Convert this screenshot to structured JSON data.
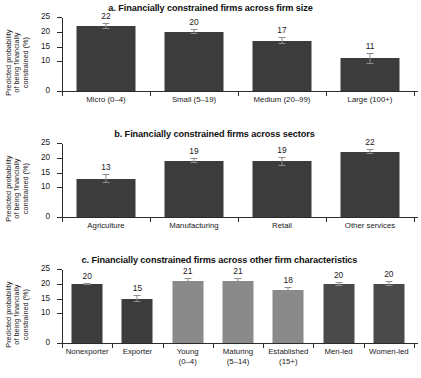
{
  "chart_data": [
    {
      "type": "bar",
      "panel": "a",
      "title": "a. Financially constrained firms across firm size",
      "ylabel": "Predicted probability of being financially constrained (%)",
      "ylabel_lines": [
        "Predicted probability",
        "of being financially",
        "constrained (%)"
      ],
      "xlabel": "",
      "ylim": [
        0,
        25
      ],
      "yticks": [
        0,
        10,
        15,
        20,
        25
      ],
      "ytick_labels": [
        "0",
        "10",
        "15",
        "20",
        "25"
      ],
      "grid": false,
      "legend": "none",
      "categories": [
        "Micro (0–4)",
        "Small (5–19)",
        "Medium (20–99)",
        "Large (100+)"
      ],
      "category_lines": [
        [
          "Micro (0–4)"
        ],
        [
          "Small (5–19)"
        ],
        [
          "Medium (20–99)"
        ],
        [
          "Large (100+)"
        ]
      ],
      "values": [
        22,
        20,
        17,
        11
      ],
      "value_labels": [
        "22",
        "20",
        "17",
        "11"
      ],
      "errors_low": [
        21.0,
        19.2,
        15.8,
        9.2
      ],
      "errors_high": [
        23.0,
        20.9,
        18.2,
        12.9
      ],
      "bar_colors": [
        "#3c3c3c",
        "#3c3c3c",
        "#3c3c3c",
        "#3c3c3c"
      ]
    },
    {
      "type": "bar",
      "panel": "b",
      "title": "b. Financially constrained firms across sectors",
      "ylabel": "Predicted probability of being financially constrained (%)",
      "ylabel_lines": [
        "Predicted probability",
        "of being financially",
        "constrained (%)"
      ],
      "xlabel": "",
      "ylim": [
        0,
        25
      ],
      "yticks": [
        0,
        10,
        15,
        20,
        25
      ],
      "ytick_labels": [
        "0",
        "10",
        "15",
        "20",
        "25"
      ],
      "grid": false,
      "legend": "none",
      "categories": [
        "Agriculture",
        "Manufacturing",
        "Retail",
        "Other services"
      ],
      "category_lines": [
        [
          "Agriculture"
        ],
        [
          "Manufacturing"
        ],
        [
          "Retail"
        ],
        [
          "Other services"
        ]
      ],
      "values": [
        13,
        19,
        19,
        22
      ],
      "value_labels": [
        "13",
        "19",
        "19",
        "22"
      ],
      "errors_low": [
        11.6,
        18.1,
        17.4,
        21.2
      ],
      "errors_high": [
        14.4,
        20.0,
        20.3,
        23.0
      ],
      "bar_colors": [
        "#3c3c3c",
        "#3c3c3c",
        "#3c3c3c",
        "#3c3c3c"
      ]
    },
    {
      "type": "bar",
      "panel": "c",
      "title": "c. Financially constrained firms across other firm characteristics",
      "ylabel": "Predicted probability of being financially constrained (%)",
      "ylabel_lines": [
        "Predicted probability",
        "of being financially",
        "constrained (%)"
      ],
      "xlabel": "",
      "ylim": [
        0,
        25
      ],
      "yticks": [
        0,
        10,
        15,
        20,
        25
      ],
      "ytick_labels": [
        "0",
        "10",
        "15",
        "20",
        "25"
      ],
      "grid": false,
      "legend": "none",
      "categories": [
        "Nonexporter",
        "Exporter",
        "Young (0–4)",
        "Maturing (5–14)",
        "Established (15+)",
        "Men-led",
        "Women-led"
      ],
      "category_lines": [
        [
          "Nonexporter"
        ],
        [
          "Exporter"
        ],
        [
          "Young",
          "(0–4)"
        ],
        [
          "Maturing",
          "(5–14)"
        ],
        [
          "Established",
          "(15+)"
        ],
        [
          "Men-led"
        ],
        [
          "Women-led"
        ]
      ],
      "values": [
        20,
        15,
        21,
        21,
        18,
        20,
        20
      ],
      "value_labels": [
        "20",
        "15",
        "21",
        "21",
        "18",
        "20",
        "20"
      ],
      "errors_low": [
        19.5,
        13.8,
        20.0,
        20.2,
        17.1,
        19.3,
        19.1
      ],
      "errors_high": [
        20.4,
        16.3,
        22.1,
        21.9,
        18.9,
        20.6,
        20.9
      ],
      "bar_colors": [
        "#3c3c3c",
        "#3c3c3c",
        "#8a8a8a",
        "#8a8a8a",
        "#8a8a8a",
        "#4a4a4a",
        "#4a4a4a"
      ]
    }
  ]
}
